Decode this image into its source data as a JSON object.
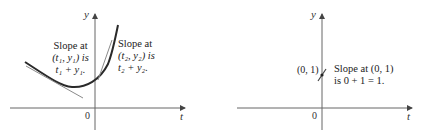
{
  "left_panel": {
    "y_axis_label": "y",
    "t_axis_label": "t",
    "origin_label": "0",
    "annotation_1": {
      "line1": "Slope at",
      "line2": "(t₁, y₁) is",
      "line3": "t₁ + y₁."
    },
    "annotation_2": {
      "line1": "Slope at",
      "line2": "(t₂, y₂) is",
      "line3": "t₂ + y₂."
    }
  },
  "right_panel": {
    "y_axis_label": "y",
    "t_axis_label": "t",
    "origin_label": "0",
    "point_label": "(0, 1)",
    "annotation": {
      "line1": "Slope at (0, 1)",
      "line2": "is 0 + 1 = 1."
    }
  },
  "colors": {
    "curve": "#2a2a2a",
    "tangent": "#8a8a8a",
    "axis": "#666666"
  }
}
